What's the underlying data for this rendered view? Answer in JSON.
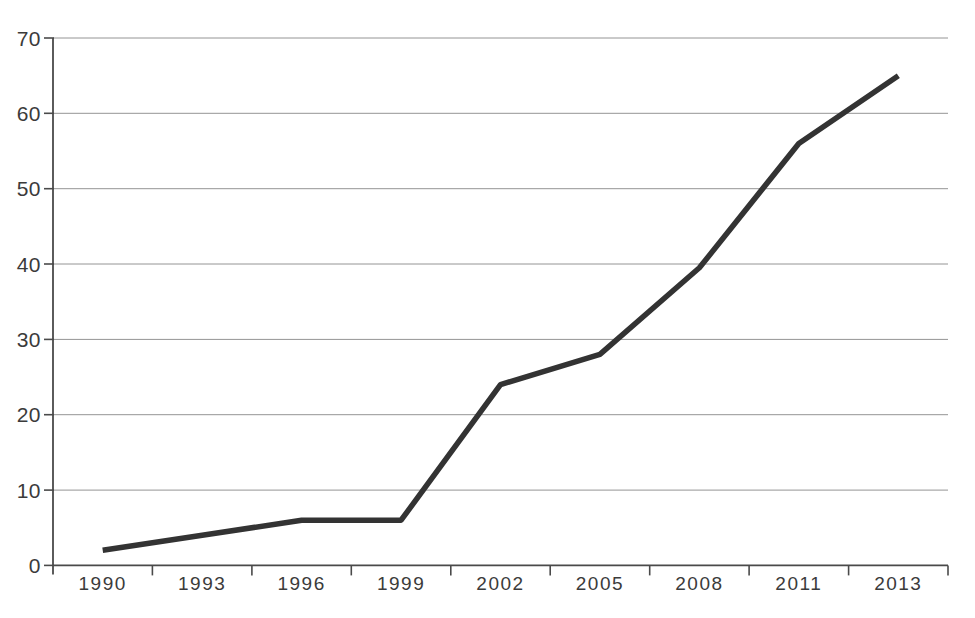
{
  "figure": {
    "background": "#ffffff"
  },
  "chart_data": {
    "type": "line",
    "title": "",
    "xlabel": "",
    "ylabel": "",
    "categories": [
      "1990",
      "1993",
      "1996",
      "1999",
      "2002",
      "2005",
      "2008",
      "2011",
      "2013"
    ],
    "series": [
      {
        "name": "series-1",
        "values": [
          2,
          4,
          6,
          6,
          24,
          28,
          39.5,
          56,
          65
        ]
      }
    ],
    "ylim": [
      0,
      70
    ],
    "yticks": [
      0,
      10,
      20,
      30,
      40,
      50,
      60,
      70
    ],
    "grid": "horizontal",
    "legend": "none",
    "styles": {
      "line_color": "#333333",
      "grid_color": "#949494",
      "axis_color": "#4a4a4a",
      "label_color": "#3b3b3b"
    }
  }
}
